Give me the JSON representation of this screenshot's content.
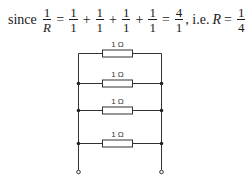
{
  "equation": {
    "prefix": "since",
    "lhs": {
      "num": "1",
      "den": "R"
    },
    "op_eq": "=",
    "terms": [
      {
        "num": "1",
        "den": "1"
      },
      {
        "num": "1",
        "den": "1"
      },
      {
        "num": "1",
        "den": "1"
      },
      {
        "num": "1",
        "den": "1"
      }
    ],
    "op_plus": "+",
    "result": {
      "num": "4",
      "den": "1"
    },
    "ie_text": ", i.e.",
    "R_symbol": "R",
    "final": {
      "num": "1",
      "den": "4"
    },
    "unit": "Ω"
  },
  "circuit": {
    "resistors": [
      {
        "label": "1 Ω"
      },
      {
        "label": "1 Ω"
      },
      {
        "label": "1 Ω"
      },
      {
        "label": "1 Ω"
      }
    ],
    "colors": {
      "wire": "#333333",
      "resistor_fill": "#ffffff"
    }
  }
}
